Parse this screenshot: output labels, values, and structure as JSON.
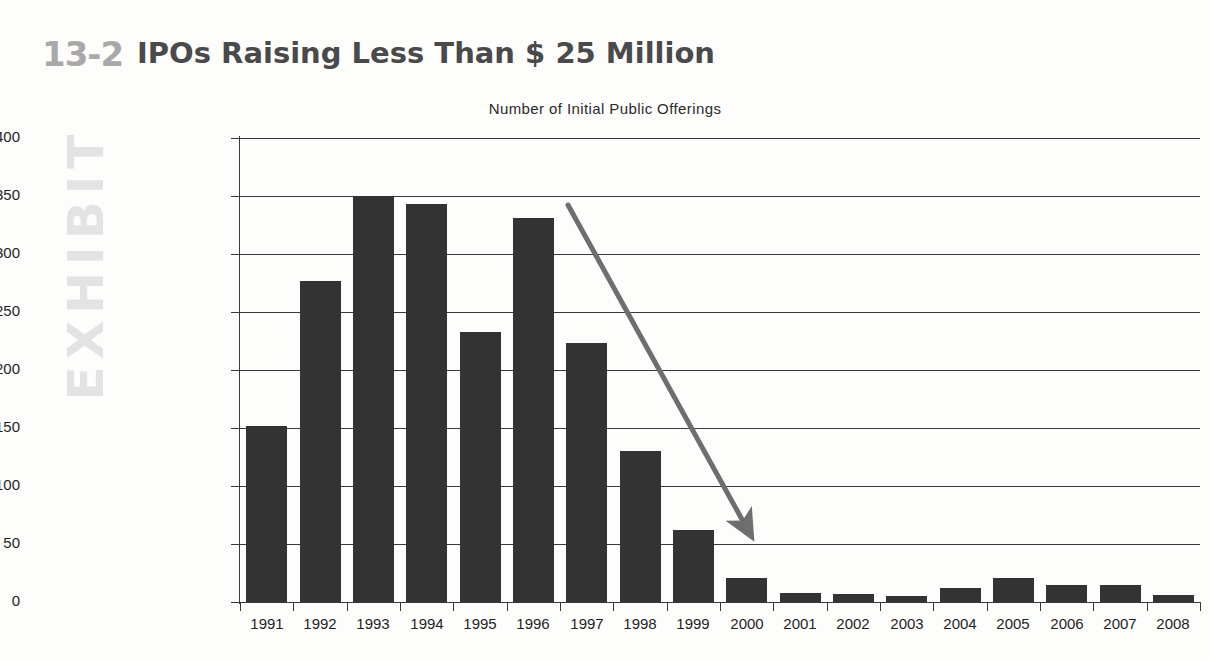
{
  "exhibit": {
    "number": "13-2",
    "word": "EXHIBIT",
    "title": "IPOs Raising Less Than $ 25 Million"
  },
  "colors": {
    "bar": "#333333",
    "axis": "#3a3a3a",
    "arrow": "#6e6e6e",
    "exhibit_number": "#a8a8a8",
    "exhibit_word": "#e3e3e3",
    "title": "#4a4a4a",
    "background": "#fdfdfc"
  },
  "annotation": {
    "name": "declining-trend-arrow",
    "x1": 568,
    "y1": 205,
    "x2": 744,
    "y2": 523
  },
  "chart_data": {
    "type": "bar",
    "title": "IPOs Raising Less Than $ 25 Million",
    "subtitle": "Number of Initial Public Offerings",
    "xlabel": "",
    "ylabel": "Number of Initial Public Offerings",
    "ylim": [
      0,
      400
    ],
    "yticks": [
      0,
      50,
      100,
      150,
      200,
      250,
      300,
      350,
      400
    ],
    "ytick_labels": [
      "0",
      "50",
      "100",
      "150",
      "200",
      "250",
      "300",
      "350",
      "400"
    ],
    "grid": true,
    "legend": "none",
    "categories": [
      "1991",
      "1992",
      "1993",
      "1994",
      "1995",
      "1996",
      "1997",
      "1998",
      "1999",
      "2000",
      "2001",
      "2002",
      "2003",
      "2004",
      "2005",
      "2006",
      "2007",
      "2008"
    ],
    "values": [
      152,
      277,
      350,
      343,
      233,
      331,
      223,
      130,
      62,
      21,
      8,
      7,
      5,
      12,
      21,
      15,
      15,
      6
    ],
    "annotations": [
      {
        "type": "arrow",
        "text": "",
        "from": "1996 peak",
        "to": "2000 trough"
      }
    ]
  }
}
